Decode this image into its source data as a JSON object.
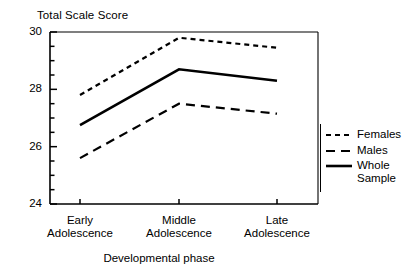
{
  "chart_data": {
    "type": "line",
    "title": "",
    "ylabel": "Total Scale Score",
    "xlabel": "Developmental phase",
    "categories": [
      "Early\nAdolescence",
      "Middle\nAdolescence",
      "Late\nAdolescence"
    ],
    "ylim": [
      24,
      30
    ],
    "yticks": [
      24,
      26,
      28,
      30
    ],
    "ytick_labels": [
      "24",
      "26",
      "28",
      "30"
    ],
    "yminor_step": 0.5,
    "grid": false,
    "legend_position": "right",
    "series": [
      {
        "name": "Females",
        "values": [
          27.8,
          29.8,
          29.45
        ],
        "style": "dotted",
        "color": "#000000"
      },
      {
        "name": "Males",
        "values": [
          25.6,
          27.5,
          27.15
        ],
        "style": "dashed",
        "color": "#000000"
      },
      {
        "name": "Whole\nSample",
        "values": [
          26.75,
          28.7,
          28.3
        ],
        "style": "solid",
        "color": "#000000"
      }
    ]
  },
  "axis": {
    "y_title": "Total Scale Score",
    "x_title": "Developmental phase",
    "y_labels": [
      "30",
      "28",
      "26",
      "24"
    ],
    "x_labels": [
      "Early\nAdolescence",
      "Middle\nAdolescence",
      "Late\nAdolescence"
    ]
  },
  "legend": {
    "items": [
      {
        "label": "Females",
        "style": "dotted"
      },
      {
        "label": "Males",
        "style": "dashed"
      },
      {
        "label": "Whole\nSample",
        "style": "solid"
      }
    ]
  },
  "colors": {
    "ink": "#000000",
    "background": "#ffffff"
  }
}
